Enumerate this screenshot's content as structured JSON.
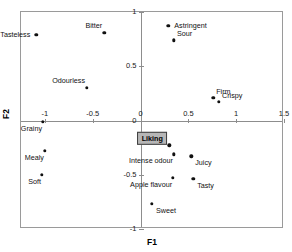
{
  "chart_data": {
    "type": "scatter",
    "title": "",
    "subtitle": "",
    "xlabel": "F1",
    "ylabel": "F2",
    "xlim": [
      -1.25,
      1.5
    ],
    "ylim": [
      -1.0,
      1.0
    ],
    "xticks": [
      "-1",
      "-0.5",
      "0",
      "0.5",
      "1",
      "1.5"
    ],
    "xtick_values": [
      -1,
      -0.5,
      0,
      0.5,
      1,
      1.5
    ],
    "yticks": [
      "1",
      "0.5",
      "0",
      "-0.5",
      "-1"
    ],
    "ytick_values": [
      1,
      0.5,
      0,
      -0.5,
      -1
    ],
    "grid": false,
    "legend": "none",
    "axes_at_zero": true,
    "points": [
      {
        "label": "Tasteless",
        "x": -1.09,
        "y": 0.79,
        "label_pos": "left",
        "highlight": false
      },
      {
        "label": "Bitter",
        "x": -0.38,
        "y": 0.81,
        "label_pos": "upper-left",
        "highlight": false
      },
      {
        "label": "Odourless",
        "x": -0.56,
        "y": 0.3,
        "label_pos": "upper-left",
        "highlight": false
      },
      {
        "label": "Astringent",
        "x": 0.29,
        "y": 0.87,
        "label_pos": "right",
        "highlight": false
      },
      {
        "label": "Sour",
        "x": 0.35,
        "y": 0.74,
        "label_pos": "upper-right",
        "highlight": false
      },
      {
        "label": "Firm",
        "x": 0.76,
        "y": 0.21,
        "label_pos": "upper-right",
        "highlight": false
      },
      {
        "label": "Crispy",
        "x": 0.82,
        "y": 0.17,
        "label_pos": "upper-right",
        "highlight": false
      },
      {
        "label": "Grainy",
        "x": -1.02,
        "y": -0.01,
        "label_pos": "lower-left",
        "highlight": false
      },
      {
        "label": "Mealy",
        "x": -1.0,
        "y": -0.28,
        "label_pos": "lower-left",
        "highlight": false
      },
      {
        "label": "Soft",
        "x": -1.03,
        "y": -0.5,
        "label_pos": "lower-left",
        "highlight": false
      },
      {
        "label": "Liking",
        "x": 0.3,
        "y": -0.23,
        "label_pos": "upper-left",
        "highlight": true
      },
      {
        "label": "Intense odour",
        "x": 0.35,
        "y": -0.31,
        "label_pos": "lower-left",
        "highlight": false
      },
      {
        "label": "Juicy",
        "x": 0.53,
        "y": -0.33,
        "label_pos": "lower-right",
        "highlight": false
      },
      {
        "label": "Apple flavour",
        "x": 0.34,
        "y": -0.53,
        "label_pos": "lower-left",
        "highlight": false
      },
      {
        "label": "Tasty",
        "x": 0.55,
        "y": -0.54,
        "label_pos": "lower-right",
        "highlight": false
      },
      {
        "label": "Sweet",
        "x": 0.12,
        "y": -0.77,
        "label_pos": "lower-right",
        "highlight": false
      }
    ]
  },
  "colors": {
    "point": "#111111",
    "frame": "#9a9a9a",
    "axis": "#8d8d8d",
    "highlight_fill": "#b6b6b6",
    "highlight_border": "#3d3d3d",
    "text": "#111111",
    "background": "#ffffff"
  }
}
